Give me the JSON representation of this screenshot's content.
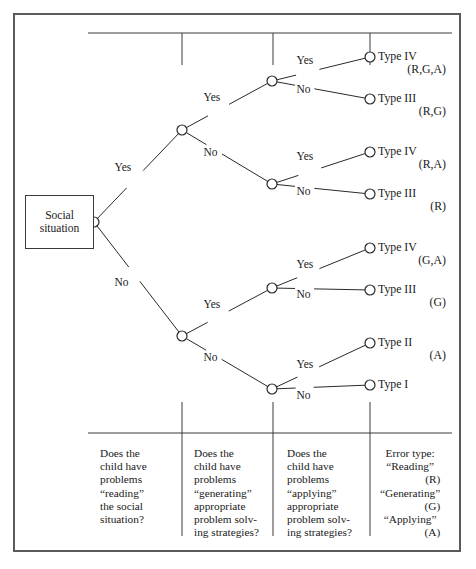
{
  "figure": {
    "root_box": {
      "line1": "Social",
      "line2": "situation"
    },
    "branch_labels": {
      "yes": "Yes",
      "no": "No"
    },
    "nodes": [
      {
        "id": "root",
        "x": 94,
        "y": 222,
        "question_column": 1
      },
      {
        "id": "r-yes",
        "x": 182,
        "y": 130,
        "question_column": 2
      },
      {
        "id": "r-no",
        "x": 182,
        "y": 336,
        "question_column": 2
      },
      {
        "id": "ry-yes",
        "x": 272,
        "y": 81,
        "question_column": 3
      },
      {
        "id": "ry-no",
        "x": 272,
        "y": 184,
        "question_column": 3
      },
      {
        "id": "rn-yes",
        "x": 272,
        "y": 288,
        "question_column": 3
      },
      {
        "id": "rn-no",
        "x": 272,
        "y": 389,
        "question_column": 3
      }
    ],
    "edges": [
      {
        "from": "root",
        "to": "r-yes",
        "label": "Yes",
        "label_x": 123,
        "label_y": 168
      },
      {
        "from": "root",
        "to": "r-no",
        "label": "No",
        "label_x": 123,
        "label_y": 283
      },
      {
        "from": "r-yes",
        "to": "ry-yes",
        "label": "Yes",
        "label_x": 212,
        "label_y": 98
      },
      {
        "from": "r-yes",
        "to": "ry-no",
        "label": "No",
        "label_x": 212,
        "label_y": 153
      },
      {
        "from": "r-no",
        "to": "rn-yes",
        "label": "Yes",
        "label_x": 212,
        "label_y": 305
      },
      {
        "from": "r-no",
        "to": "rn-no",
        "label": "No",
        "label_x": 212,
        "label_y": 358
      },
      {
        "from": "ry-yes",
        "to": "leaf1",
        "label": "Yes",
        "label_x": 305,
        "label_y": 61
      },
      {
        "from": "ry-yes",
        "to": "leaf2",
        "label": "No",
        "label_x": 305,
        "label_y": 90
      },
      {
        "from": "ry-no",
        "to": "leaf3",
        "label": "Yes",
        "label_x": 305,
        "label_y": 157
      },
      {
        "from": "ry-no",
        "to": "leaf4",
        "label": "No",
        "label_x": 305,
        "label_y": 192
      },
      {
        "from": "rn-yes",
        "to": "leaf5",
        "label": "Yes",
        "label_x": 305,
        "label_y": 265
      },
      {
        "from": "rn-yes",
        "to": "leaf6",
        "label": "No",
        "label_x": 305,
        "label_y": 295
      },
      {
        "from": "rn-no",
        "to": "leaf7",
        "label": "Yes",
        "label_x": 305,
        "label_y": 365
      },
      {
        "from": "rn-no",
        "to": "leaf8",
        "label": "No",
        "label_x": 305,
        "label_y": 396
      }
    ],
    "leaves": [
      {
        "id": "leaf1",
        "x": 370,
        "y": 57,
        "type": "Type IV",
        "code": "(R,G,A)"
      },
      {
        "id": "leaf2",
        "x": 370,
        "y": 99,
        "type": "Type III",
        "code": "(R,G)"
      },
      {
        "id": "leaf3",
        "x": 370,
        "y": 152,
        "type": "Type IV",
        "code": "(R,A)"
      },
      {
        "id": "leaf4",
        "x": 370,
        "y": 194,
        "type": "Type III",
        "code": "(R)"
      },
      {
        "id": "leaf5",
        "x": 370,
        "y": 248,
        "type": "Type IV",
        "code": "(G,A)"
      },
      {
        "id": "leaf6",
        "x": 370,
        "y": 290,
        "type": "Type III",
        "code": "(G)"
      },
      {
        "id": "leaf7",
        "x": 370,
        "y": 343,
        "type": "Type II",
        "code": "(A)"
      },
      {
        "id": "leaf8",
        "x": 370,
        "y": 385,
        "type": "Type I",
        "code": ""
      }
    ],
    "rules": {
      "top_y": 33,
      "bottom_y": 433,
      "left_x": 88,
      "right_x": 452,
      "tick_x": [
        182,
        273,
        370
      ],
      "top_tick_bottom": 65,
      "bottom_tick_top": 402,
      "divider_bottom": 536
    },
    "columns": [
      {
        "id": "column-reading",
        "x": 100,
        "lines": [
          "Does the",
          "child have",
          "problems",
          "“reading”",
          "the social",
          "situation?"
        ]
      },
      {
        "id": "column-generating",
        "x": 194,
        "lines": [
          "Does the",
          "child have",
          "problems",
          "“generating”",
          "appropriate",
          "problem solv-",
          "ing strategies?"
        ]
      },
      {
        "id": "column-applying",
        "x": 287,
        "lines": [
          "Does the",
          "child have",
          "problems",
          "“applying”",
          "appropriate",
          "problem solv-",
          "ing strategies?"
        ]
      },
      {
        "id": "column-error-type",
        "x": 380,
        "title": "Error type:",
        "entries": [
          {
            "name": "“Reading”",
            "code": "(R)"
          },
          {
            "name": "“Generating”",
            "code": "(G)"
          },
          {
            "name": "“Applying”",
            "code": "(A)"
          }
        ]
      }
    ],
    "colors": {
      "ink": "#1a1a1a",
      "frame": "#5a5a5a",
      "rule": "#3a3a3a",
      "paper": "#ffffff"
    }
  }
}
